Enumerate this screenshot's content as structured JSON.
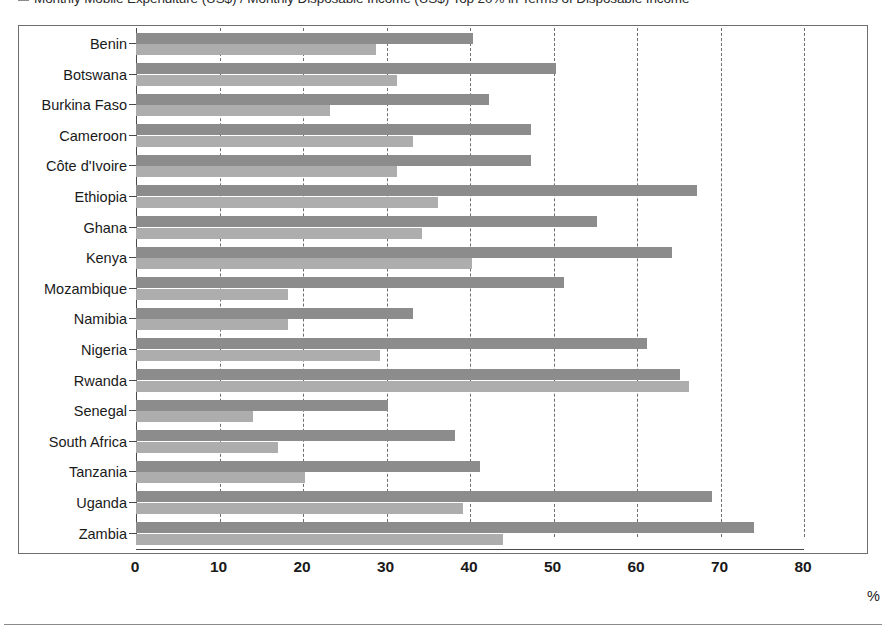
{
  "legend": {
    "series_label": "Monthly Mobile Expenditure (US$) / Monthly Disposable Income (US$) Top 20% in Terms of Disposable Income",
    "swatch_color": "#8c8c8c"
  },
  "axis": {
    "unit_label": "%",
    "tick_labels": [
      "0",
      "10",
      "20",
      "30",
      "40",
      "50",
      "60",
      "70",
      "80"
    ]
  },
  "colors": {
    "series_1": "#8c8c8c",
    "series_2": "#adadad",
    "frame": "#6e6e6e",
    "text": "#1a1a1a",
    "background": "#ffffff"
  },
  "chart_data": {
    "type": "bar",
    "orientation": "horizontal",
    "title": "",
    "subtitle": "",
    "xlabel": "%",
    "ylabel": "",
    "xlim": [
      0,
      80
    ],
    "xticks": [
      0,
      10,
      20,
      30,
      40,
      50,
      60,
      70,
      80
    ],
    "grid": true,
    "grid_axis": "x",
    "grid_style": "dashed",
    "legend_position": "top-left",
    "categories": [
      "Benin",
      "Botswana",
      "Burkina Faso",
      "Cameroon",
      "Côte d'Ivoire",
      "Ethiopia",
      "Ghana",
      "Kenya",
      "Mozambique",
      "Namibia",
      "Nigeria",
      "Rwanda",
      "Senegal",
      "South Africa",
      "Tanzania",
      "Uganda",
      "Zambia"
    ],
    "series": [
      {
        "name": "Monthly Mobile Expenditure (US$) / Monthly Disposable Income (US$)",
        "color": "#8c8c8c",
        "values": [
          40.3,
          50.3,
          42.3,
          47.3,
          47.3,
          67.2,
          55.2,
          64.2,
          51.2,
          33.2,
          61.2,
          65.2,
          30.2,
          38.2,
          41.2,
          69.0,
          74.0
        ]
      },
      {
        "name": "Top 20% in Terms of Disposable Income",
        "color": "#adadad",
        "values": [
          28.8,
          31.2,
          23.2,
          33.2,
          31.2,
          36.2,
          34.2,
          40.2,
          18.2,
          18.2,
          29.2,
          66.2,
          14.0,
          17.0,
          20.2,
          39.2,
          44.0
        ]
      }
    ]
  }
}
